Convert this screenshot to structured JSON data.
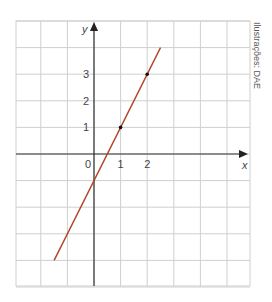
{
  "chart_data": {
    "type": "line",
    "title": "",
    "xlabel": "x",
    "ylabel": "y",
    "x_tick_labels": [
      "0",
      "1",
      "2"
    ],
    "y_tick_labels": [
      "1",
      "2",
      "3"
    ],
    "xlim": [
      -3,
      6
    ],
    "ylim": [
      -5,
      5
    ],
    "grid": true,
    "series": [
      {
        "name": "y = 2x - 1",
        "color": "#b0442a",
        "x": [
          -1.5,
          2.5
        ],
        "y": [
          -4,
          4
        ]
      }
    ],
    "marked_points": [
      {
        "x": 1,
        "y": 1
      },
      {
        "x": 2,
        "y": 3
      }
    ],
    "credit": "Ilustrações: DAE"
  }
}
